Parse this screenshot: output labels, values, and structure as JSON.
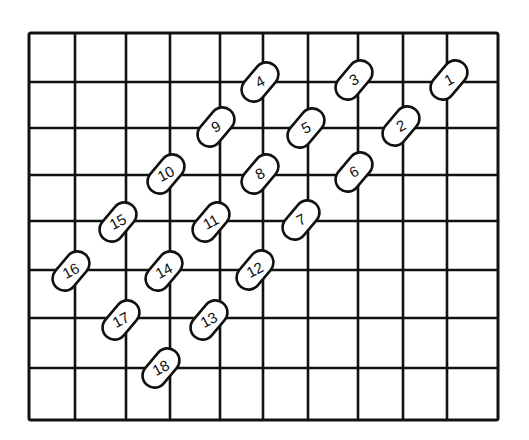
{
  "diagram": {
    "type": "grid-with-numbered-pills",
    "grid": {
      "columns": 10,
      "rows": 8,
      "line_color": "#111111",
      "background": "#ffffff",
      "x_lines": [
        29,
        75,
        126,
        170,
        220,
        263,
        308,
        358,
        403,
        447,
        498
      ],
      "y_lines": [
        33,
        82,
        128,
        175,
        221,
        270,
        318,
        368,
        420
      ]
    },
    "pills": [
      {
        "label": "1",
        "cx": 449,
        "cy": 80
      },
      {
        "label": "2",
        "cx": 401,
        "cy": 126
      },
      {
        "label": "3",
        "cx": 354,
        "cy": 80
      },
      {
        "label": "4",
        "cx": 260,
        "cy": 82
      },
      {
        "label": "5",
        "cx": 306,
        "cy": 128
      },
      {
        "label": "6",
        "cx": 354,
        "cy": 172
      },
      {
        "label": "7",
        "cx": 301,
        "cy": 220
      },
      {
        "label": "8",
        "cx": 260,
        "cy": 174
      },
      {
        "label": "9",
        "cx": 216,
        "cy": 127
      },
      {
        "label": "10",
        "cx": 166,
        "cy": 174
      },
      {
        "label": "11",
        "cx": 211,
        "cy": 222
      },
      {
        "label": "12",
        "cx": 255,
        "cy": 270
      },
      {
        "label": "13",
        "cx": 209,
        "cy": 320
      },
      {
        "label": "14",
        "cx": 164,
        "cy": 271
      },
      {
        "label": "15",
        "cx": 118,
        "cy": 222
      },
      {
        "label": "16",
        "cx": 71,
        "cy": 271
      },
      {
        "label": "17",
        "cx": 121,
        "cy": 320
      },
      {
        "label": "18",
        "cx": 161,
        "cy": 368
      }
    ]
  }
}
